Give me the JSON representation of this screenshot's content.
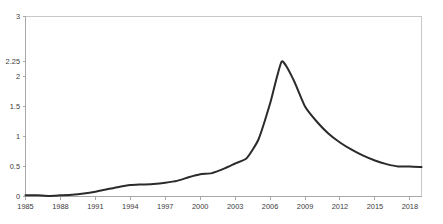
{
  "chart_data": {
    "type": "line",
    "title": "",
    "subtitle": "",
    "xlabel": "",
    "ylabel": "",
    "grid": false,
    "legend": false,
    "legend_position": "none",
    "xlim": [
      1985,
      2019
    ],
    "ylim": [
      0,
      3
    ],
    "x_tick_labels": [
      "1985",
      "1988",
      "1991",
      "1994",
      "1997",
      "2000",
      "2003",
      "2006",
      "2009",
      "2012",
      "2015",
      "2018"
    ],
    "x_ticks": [
      1985,
      1988,
      1991,
      1994,
      1997,
      2000,
      2003,
      2006,
      2009,
      2012,
      2015,
      2018
    ],
    "y_tick_labels": [
      "0",
      "0.5",
      "1",
      "1.5",
      "2",
      "2.25",
      "3"
    ],
    "y_ticks": [
      0,
      0.5,
      1,
      1.5,
      2,
      2.25,
      3
    ],
    "series": [
      {
        "name": "series-1",
        "color": "#2b2b2b",
        "x": [
          1985,
          1986,
          1987,
          1988,
          1989,
          1990,
          1991,
          1992,
          1993,
          1994,
          1995,
          1996,
          1997,
          1998,
          1999,
          2000,
          2001,
          2002,
          2003,
          2004,
          2005,
          2006,
          2007,
          2008,
          2009,
          2010,
          2011,
          2012,
          2013,
          2014,
          2015,
          2016,
          2017,
          2018,
          2019
        ],
        "values": [
          0.02,
          0.02,
          0.01,
          0.02,
          0.03,
          0.05,
          0.08,
          0.12,
          0.16,
          0.19,
          0.2,
          0.21,
          0.23,
          0.26,
          0.32,
          0.37,
          0.39,
          0.46,
          0.55,
          0.64,
          0.95,
          1.55,
          2.25,
          1.95,
          1.5,
          1.25,
          1.05,
          0.9,
          0.78,
          0.68,
          0.6,
          0.54,
          0.5,
          0.5,
          0.49
        ]
      }
    ],
    "peak": {
      "x": 2007,
      "y": 2.25
    }
  },
  "axes": {
    "x_axis_name": "x-axis",
    "y_axis_name": "y-axis"
  }
}
